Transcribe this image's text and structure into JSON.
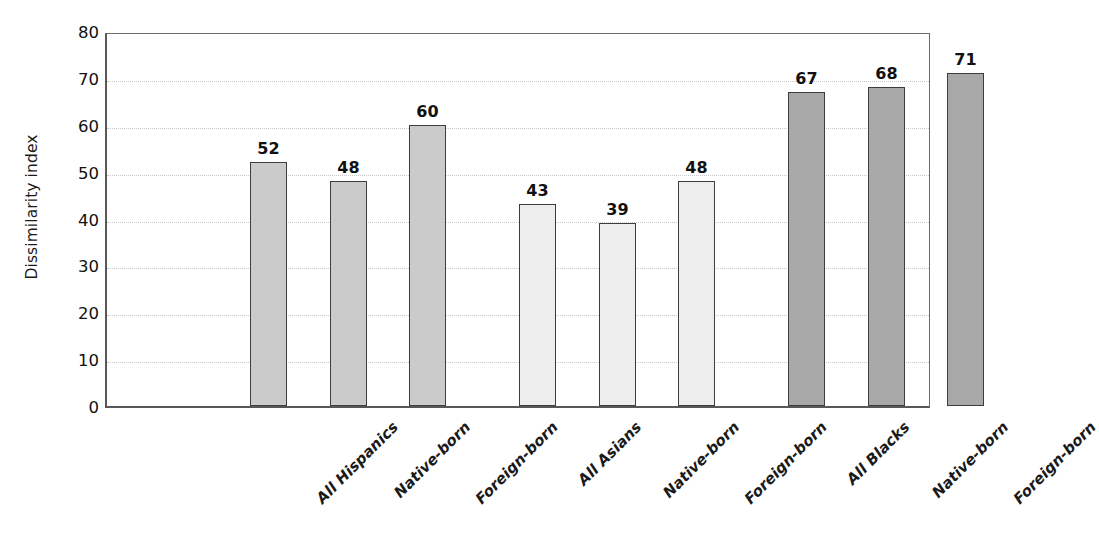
{
  "chart_data": {
    "type": "bar",
    "title": "",
    "xlabel": "",
    "ylabel": "Dissimilarity index",
    "ylim": [
      0,
      80
    ],
    "yticks": [
      0,
      10,
      20,
      30,
      40,
      50,
      60,
      70,
      80
    ],
    "ytick_labels": [
      "0",
      "10",
      "20",
      "30",
      "40",
      "50",
      "60",
      "70",
      "80"
    ],
    "grid": "horizontal-dotted",
    "legend": "none",
    "categories": [
      "All Hispanics",
      "Native-born",
      "Foreign-born",
      "All Asians",
      "Native-born",
      "Foreign-born",
      "All Blacks",
      "Native-born",
      "Foreign-born"
    ],
    "values": [
      52,
      48,
      60,
      43,
      39,
      48,
      67,
      68,
      71
    ],
    "value_labels": [
      "52",
      "48",
      "60",
      "43",
      "39",
      "48",
      "67",
      "68",
      "71"
    ],
    "groups": [
      {
        "name": "Hispanics",
        "color": "#cbcbcb",
        "categories": [
          "All Hispanics",
          "Native-born",
          "Foreign-born"
        ],
        "values": [
          52,
          48,
          60
        ]
      },
      {
        "name": "Asians",
        "color": "#ededed",
        "categories": [
          "All Asians",
          "Native-born",
          "Foreign-born"
        ],
        "values": [
          43,
          39,
          48
        ]
      },
      {
        "name": "Blacks",
        "color": "#a8a8a8",
        "categories": [
          "All Blacks",
          "Native-born",
          "Foreign-born"
        ],
        "values": [
          67,
          68,
          71
        ]
      }
    ],
    "bars": [
      {
        "label": "All Hispanics",
        "value": 52,
        "value_label": "52",
        "color": "#cbcbcb",
        "group": "Hispanics"
      },
      {
        "label": "Native-born",
        "value": 48,
        "value_label": "48",
        "color": "#cbcbcb",
        "group": "Hispanics"
      },
      {
        "label": "Foreign-born",
        "value": 60,
        "value_label": "60",
        "color": "#cbcbcb",
        "group": "Hispanics"
      },
      {
        "label": "All Asians",
        "value": 43,
        "value_label": "43",
        "color": "#ededed",
        "group": "Asians"
      },
      {
        "label": "Native-born",
        "value": 39,
        "value_label": "39",
        "color": "#ededed",
        "group": "Asians"
      },
      {
        "label": "Foreign-born",
        "value": 48,
        "value_label": "48",
        "color": "#ededed",
        "group": "Asians"
      },
      {
        "label": "All Blacks",
        "value": 67,
        "value_label": "67",
        "color": "#a8a8a8",
        "group": "Blacks"
      },
      {
        "label": "Native-born",
        "value": 68,
        "value_label": "68",
        "color": "#a8a8a8",
        "group": "Blacks"
      },
      {
        "label": "Foreign-born",
        "value": 71,
        "value_label": "71",
        "color": "#a8a8a8",
        "group": "Blacks"
      }
    ],
    "colors": {
      "hispanics": "#cbcbcb",
      "asians": "#ededed",
      "blacks": "#a8a8a8",
      "bar_outline": "#3d3d3d",
      "axis": "#575757",
      "gridline": "#c9c9c9",
      "text": "#111111",
      "background": "#ffffff"
    }
  }
}
